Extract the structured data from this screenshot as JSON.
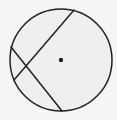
{
  "diagram": {
    "type": "circle-with-intersecting-chords",
    "colors": {
      "background": "#f5f5f5",
      "circle_fill": "#efefef",
      "stroke": "#222222"
    },
    "circle": {
      "cx": 61,
      "cy": 60,
      "r": 51,
      "stroke_width": 1.5
    },
    "center_point": {
      "x": 61,
      "y": 60,
      "r": 2.2
    },
    "chords": [
      {
        "id": "chord-1",
        "x1": 74,
        "y1": 10,
        "x2": 14,
        "y2": 80
      },
      {
        "id": "chord-2",
        "x1": 11,
        "y1": 47,
        "x2": 62,
        "y2": 111
      }
    ]
  }
}
